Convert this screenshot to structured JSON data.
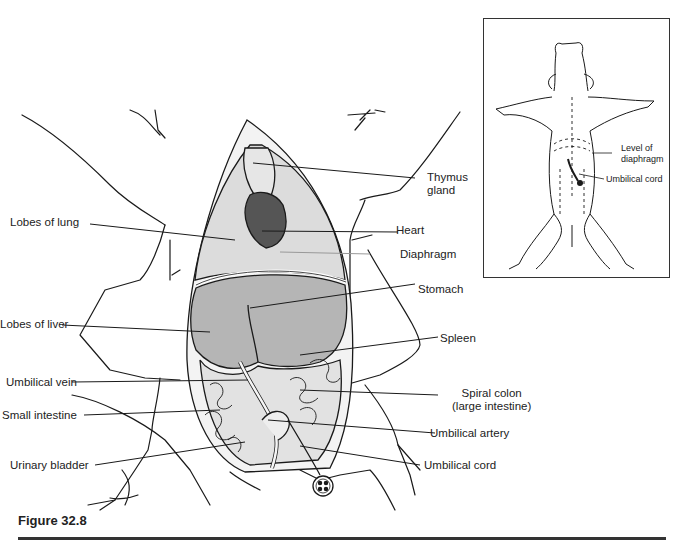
{
  "figure": {
    "caption": "Figure 32.8",
    "type": "anatomical illustration"
  },
  "main_labels": {
    "left": [
      {
        "id": "lobes-of-lung",
        "text": "Lobes of lung"
      },
      {
        "id": "lobes-of-liver",
        "text": "Lobes of liver"
      },
      {
        "id": "umbilical-vein",
        "text": "Umbilical vein"
      },
      {
        "id": "small-intestine",
        "text": "Small intestine"
      },
      {
        "id": "urinary-bladder",
        "text": "Urinary bladder"
      }
    ],
    "right": [
      {
        "id": "thymus-gland",
        "line1": "Thymus",
        "line2": "gland"
      },
      {
        "id": "heart",
        "text": "Heart"
      },
      {
        "id": "diaphragm",
        "text": "Diaphragm"
      },
      {
        "id": "stomach",
        "text": "Stomach"
      },
      {
        "id": "spleen",
        "text": "Spleen"
      },
      {
        "id": "spiral-colon",
        "line1": "Spiral colon",
        "line2": "(large intestine)"
      },
      {
        "id": "umbilical-artery",
        "text": "Umbilical artery"
      },
      {
        "id": "umbilical-cord",
        "text": "Umbilical cord"
      }
    ]
  },
  "inset": {
    "description": "Ventral view of whole fetal pig showing incision lines",
    "labels": [
      {
        "id": "level-of-diaphragm",
        "line1": "Level of",
        "line2": "diaphragm"
      },
      {
        "id": "inset-umbilical-cord",
        "text": "Umbilical cord"
      }
    ]
  },
  "colors": {
    "ink": "#1a1a1a",
    "organ_fill_light": "#d9d9d9",
    "liver_fill": "#b5b5b5",
    "heart_fill": "#555555",
    "background": "#ffffff"
  }
}
